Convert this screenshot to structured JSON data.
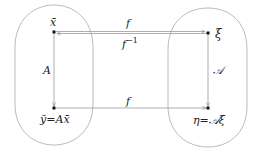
{
  "diagram": {
    "type": "commutative-diagram",
    "colors": {
      "stroke": "#9a9a9a",
      "text": "#222222",
      "node": "#111111",
      "background": "#ffffff"
    },
    "nodes": {
      "x_bar": {
        "label": "x̄"
      },
      "xi": {
        "label": "ξ"
      },
      "y_bar": {
        "label": "ȳ=Ax̄"
      },
      "eta": {
        "label": "η=𝒜ξ"
      }
    },
    "edges": {
      "f_top": {
        "label": "f",
        "from": "x_bar",
        "to": "xi"
      },
      "f_inv": {
        "label": "f",
        "sup": "−1",
        "from": "xi",
        "to": "x_bar"
      },
      "A_left": {
        "label": "A",
        "from": "x_bar",
        "to": "y_bar"
      },
      "A_right": {
        "label": "𝒜",
        "from": "xi",
        "to": "eta"
      },
      "f_bottom": {
        "label": "f",
        "from": "y_bar",
        "to": "eta"
      }
    },
    "regions": [
      "left-set",
      "right-set"
    ]
  }
}
